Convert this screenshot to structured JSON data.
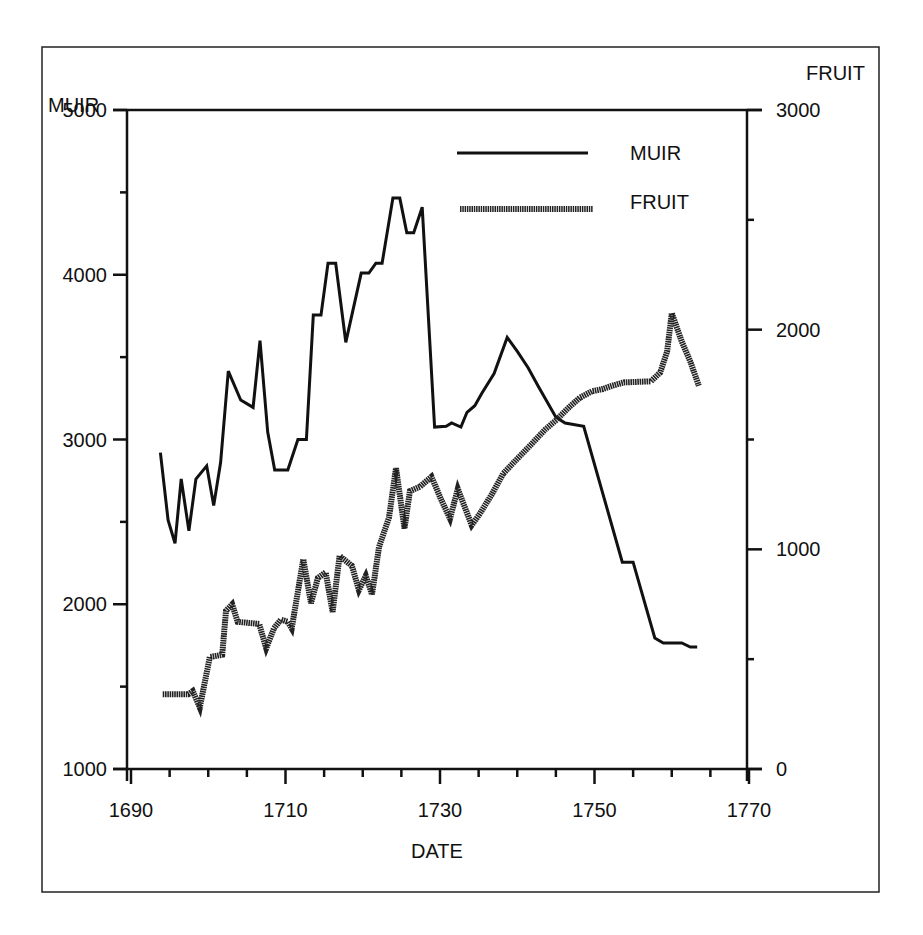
{
  "chart_data": {
    "type": "line",
    "title": "",
    "xlabel": "DATE",
    "ylabel": "MUIR",
    "y2label": "FRUIT",
    "xlim": [
      1690,
      1770
    ],
    "ylim": [
      1000,
      5000
    ],
    "y2lim": [
      0,
      3000
    ],
    "x_ticks": [
      1690,
      1710,
      1730,
      1750,
      1770
    ],
    "x_minor_step": 5,
    "y_ticks": [
      1000,
      2000,
      3000,
      4000,
      5000
    ],
    "y_minor_step": 500,
    "y2_ticks": [
      0,
      1000,
      2000,
      3000
    ],
    "y2_minor_step": 500,
    "grid": false,
    "legend_position": "upper-right-inside",
    "series": [
      {
        "name": "MUIR",
        "axis": "left",
        "style": "thin-solid",
        "color": "#111111",
        "x": [
          1693.8,
          1694.8,
          1695.7,
          1696.5,
          1697.5,
          1698.4,
          1699.8,
          1700.7,
          1701.6,
          1702.6,
          1704.2,
          1705.8,
          1706.7,
          1707.7,
          1708.6,
          1710.3,
          1711.6,
          1712.7,
          1713.6,
          1714.6,
          1715.5,
          1716.5,
          1717.8,
          1719.8,
          1720.8,
          1721.7,
          1722.5,
          1723.9,
          1724.8,
          1725.7,
          1726.6,
          1727.7,
          1729.3,
          1730.8,
          1731.5,
          1732.7,
          1733.5,
          1734.5,
          1735.4,
          1737.0,
          1738.7,
          1740.0,
          1741.4,
          1742.7,
          1745.0,
          1746.2,
          1748.6,
          1753.6,
          1755.0,
          1757.8,
          1758.9,
          1761.3,
          1762.4,
          1763.3
        ],
        "values": [
          2920,
          2510,
          2370,
          2760,
          2445,
          2760,
          2840,
          2600,
          2860,
          3415,
          3240,
          3195,
          3600,
          3045,
          2815,
          2815,
          3000,
          3000,
          3755,
          3755,
          4070,
          4070,
          3590,
          4010,
          4010,
          4070,
          4070,
          4465,
          4465,
          4255,
          4255,
          4410,
          3075,
          3080,
          3100,
          3075,
          3165,
          3205,
          3280,
          3400,
          3620,
          3535,
          3435,
          3325,
          3135,
          3100,
          3080,
          2255,
          2255,
          1795,
          1765,
          1765,
          1740,
          1740
        ]
      },
      {
        "name": "FRUIT",
        "axis": "right",
        "style": "thick-textured",
        "color": "#222222",
        "x": [
          1694.1,
          1697.4,
          1698.0,
          1698.9,
          1700.2,
          1701.0,
          1701.8,
          1702.3,
          1703.1,
          1703.8,
          1706.6,
          1707.5,
          1708.5,
          1709.4,
          1710.3,
          1710.8,
          1712.3,
          1713.3,
          1714.2,
          1715.2,
          1716.1,
          1717.0,
          1718.6,
          1719.5,
          1720.4,
          1721.2,
          1722.1,
          1723.4,
          1724.3,
          1725.4,
          1726.1,
          1727.4,
          1728.9,
          1730.1,
          1731.3,
          1732.3,
          1734.1,
          1735.2,
          1736.7,
          1738.2,
          1739.8,
          1741.6,
          1743.6,
          1745.1,
          1746.8,
          1748.1,
          1749.7,
          1751.1,
          1752.3,
          1753.8,
          1757.3,
          1758.5,
          1759.4,
          1760.0,
          1761.3,
          1762.4,
          1763.5
        ],
        "values": [
          340,
          340,
          355,
          280,
          510,
          515,
          520,
          720,
          750,
          670,
          660,
          550,
          640,
          680,
          670,
          640,
          955,
          755,
          870,
          895,
          715,
          970,
          925,
          815,
          880,
          795,
          1010,
          1145,
          1370,
          1095,
          1265,
          1285,
          1330,
          1230,
          1140,
          1275,
          1110,
          1165,
          1250,
          1345,
          1405,
          1470,
          1545,
          1590,
          1650,
          1690,
          1720,
          1730,
          1745,
          1760,
          1765,
          1805,
          1900,
          2075,
          1945,
          1855,
          1745
        ]
      }
    ]
  },
  "axes": {
    "left_title": "MUIR",
    "right_title": "FRUIT",
    "bottom_title": "DATE"
  },
  "legend": {
    "items": [
      {
        "label": "MUIR"
      },
      {
        "label": "FRUIT"
      }
    ]
  }
}
